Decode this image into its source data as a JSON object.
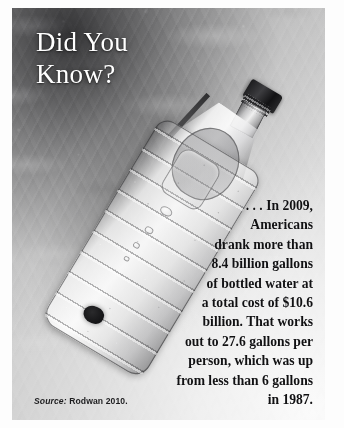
{
  "panel": {
    "title": "Did You\nKnow?",
    "body_text": ". . . In 2009, Americans drank more than 8.4 billion gallons of bottled water at a total cost of $10.6 billion. That works out to 27.6 gallons per person, which was up from less than 6 gallons in 1987.",
    "body_lines": [
      ". . . In 2009,",
      "Americans",
      "drank more than",
      "8.4 billion gallons",
      "of bottled water at",
      "a total cost of $10.6",
      "billion. That works",
      "out to 27.6 gallons per",
      "person, which was up",
      "from less than 6 gallons",
      "in 1987."
    ],
    "body_block": ". . . In 2009,\nAmericans\ndrank more than\n8.4 billion gallons\nof bottled water at\na total cost of $10.6\nbillion. That works\nout to 27.6 gallons per\nperson, which was up\nfrom less than 6 gallons\nin 1987.",
    "source_label": "Source:",
    "source_value": "Rodwan 2010.",
    "image_subject": "water-bottle-photo",
    "colors": {
      "title_text": "#ffffff",
      "body_text": "#111113",
      "source_text": "#1d1d1f",
      "background_dark": "#3a3a3c",
      "background_light": "#f7f7f7",
      "cap_dark": "#1b1b1d",
      "page": "#fdfdfd"
    },
    "facts": {
      "year": "2009",
      "gallons_consumed": "8.4 billion gallons",
      "total_cost": "$10.6 billion",
      "per_person": "27.6 gallons per person",
      "comparison_year": "1987",
      "comparison_value": "less than 6 gallons"
    }
  }
}
